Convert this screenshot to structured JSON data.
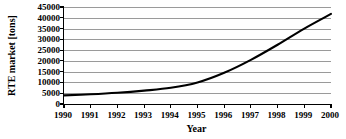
{
  "chart_data": {
    "type": "line",
    "title": "",
    "xlabel": "Year",
    "ylabel": "RTE market [tons]",
    "x": [
      1990,
      1991,
      1992,
      1993,
      1994,
      1995,
      1996,
      1997,
      1998,
      1999,
      2000
    ],
    "values": [
      4000,
      4500,
      5200,
      6200,
      7500,
      10000,
      14500,
      20500,
      27500,
      35000,
      41800
    ],
    "xtick_labels": [
      "1990",
      "1991",
      "1992",
      "1993",
      "1994",
      "1995",
      "1996",
      "1997",
      "1998",
      "1999",
      "2000"
    ],
    "ytick_labels": [
      "0",
      "5000",
      "10000",
      "15000",
      "20000",
      "25000",
      "30000",
      "35000",
      "40000",
      "45000"
    ],
    "yticks": [
      0,
      5000,
      10000,
      15000,
      20000,
      25000,
      30000,
      35000,
      40000,
      45000
    ],
    "xlim": [
      1990,
      2000
    ],
    "ylim": [
      0,
      45000
    ],
    "grid": "horizontal",
    "legend": "none",
    "series": [
      {
        "name": "RTE market",
        "values": [
          4000,
          4500,
          5200,
          6200,
          7500,
          10000,
          14500,
          20500,
          27500,
          35000,
          41800
        ],
        "color": "#000000"
      }
    ],
    "line_color": "#000000",
    "grid_color": "#9a9a9a",
    "axis_color": "#000000",
    "background_color": "#ffffff"
  }
}
